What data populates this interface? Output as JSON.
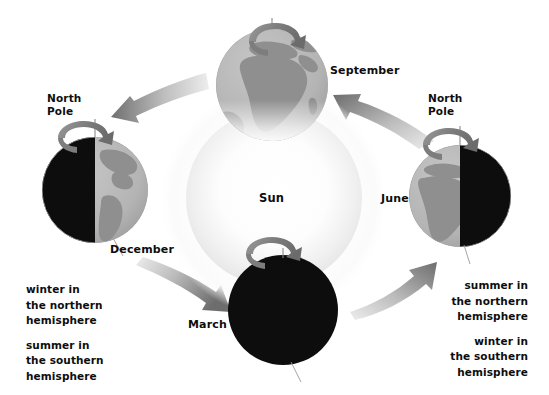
{
  "diagram": {
    "center": {
      "label": "Sun",
      "name": "sun"
    },
    "positions": [
      {
        "id": "september",
        "label": "September",
        "lit": "full",
        "visible_landmass": "Africa and Europe",
        "rotation_arrow": true,
        "pole_label": null
      },
      {
        "id": "december",
        "label": "December",
        "lit": "right-half",
        "visible_landmass": "Americas",
        "rotation_arrow": true,
        "pole_label": "North Pole"
      },
      {
        "id": "march",
        "label": "March",
        "lit": "none",
        "visible_landmass": "none",
        "rotation_arrow": true,
        "pole_label": null
      },
      {
        "id": "june",
        "label": "June",
        "lit": "left-half",
        "visible_landmass": "Africa and Europe",
        "rotation_arrow": true,
        "pole_label": "North Pole"
      }
    ],
    "pole_label_left": "North\nPole",
    "pole_label_left_line1": "North",
    "pole_label_left_line2": "Pole",
    "pole_label_right_line1": "North",
    "pole_label_right_line2": "Pole",
    "annotations": {
      "left": {
        "block1_line1": "winter in",
        "block1_line2": "the northern",
        "block1_line3": "hemisphere",
        "block2_line1": "summer in",
        "block2_line2": "the southern",
        "block2_line3": "hemisphere"
      },
      "right": {
        "block1_line1": "summer in",
        "block1_line2": "the northern",
        "block1_line3": "hemisphere",
        "block2_line1": "winter in",
        "block2_line2": "the southern",
        "block2_line3": "hemisphere"
      }
    },
    "orbit_arrows": [
      {
        "id": "to-december",
        "from": "september",
        "to": "december",
        "direction": "left"
      },
      {
        "id": "to-march",
        "from": "december",
        "to": "march",
        "direction": "down-right"
      },
      {
        "id": "to-june",
        "from": "march",
        "to": "june",
        "direction": "up-right"
      },
      {
        "id": "to-september",
        "from": "june",
        "to": "september",
        "direction": "left"
      }
    ],
    "colors": {
      "night": "#0d0d0d",
      "ocean": "#b6b6b6",
      "land": "#8f8f8f",
      "sun_core": "#ffffff",
      "sun_glow": "#ebebeb",
      "arrow_dark": "#6f6f6f",
      "arrow_light": "#e6e6e6",
      "axis_line": "#8a8a8a",
      "text": "#0d0d0d"
    }
  }
}
